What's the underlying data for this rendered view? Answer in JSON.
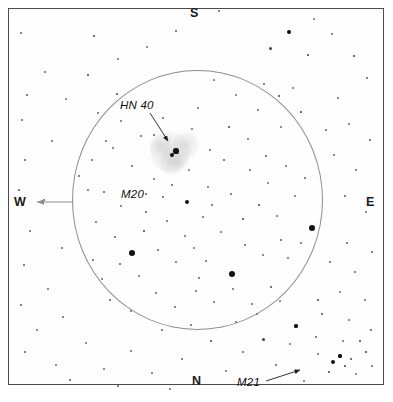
{
  "figure": {
    "kind": "star-chart",
    "frame_color": "#4b4b4b",
    "background_color": "#ffffff",
    "circle_color": "#8d8d8d",
    "star_color": "#111111",
    "nebula_color": "#d9d9d9"
  },
  "compass": {
    "north": "N",
    "south": "S",
    "east": "E",
    "west": "W"
  },
  "labels": {
    "hn40": "HN 40",
    "m20": "M20",
    "m21": "M21"
  },
  "chart_data": {
    "type": "scatter",
    "title": "",
    "subtitle": "",
    "xlabel": "",
    "ylabel": "",
    "xlim": [
      0,
      393
    ],
    "ylim": [
      0,
      402
    ],
    "grid": false,
    "legend": "none",
    "annotations": [
      {
        "text": "HN 40",
        "x": 120,
        "y": 105,
        "arrow_to": [
          168,
          143
        ],
        "style": "italic"
      },
      {
        "text": "M20",
        "x": 121,
        "y": 194,
        "arrow_to": null,
        "style": "italic"
      },
      {
        "text": "M21",
        "x": 237,
        "y": 382,
        "arrow_to": [
          300,
          369
        ],
        "style": "italic"
      },
      {
        "text": "S",
        "x": 190,
        "y": 16,
        "arrow_to": null,
        "style": "bold"
      },
      {
        "text": "N",
        "x": 192,
        "y": 384,
        "arrow_to": null,
        "style": "bold"
      },
      {
        "text": "W",
        "x": 14,
        "y": 205,
        "arrow_to": null,
        "style": "bold"
      },
      {
        "text": "E",
        "x": 366,
        "y": 205,
        "arrow_to": null,
        "style": "bold"
      }
    ],
    "fov_circle": {
      "cx": 197.5,
      "cy": 200,
      "rx": 125.5,
      "ry": 130
    },
    "west_arrow": {
      "from": [
        73,
        202
      ],
      "to": [
        35,
        202
      ]
    },
    "nebulosity": [
      {
        "cx": 170,
        "cy": 152,
        "r": 20,
        "opacity": 0.3
      },
      {
        "cx": 186,
        "cy": 145,
        "r": 13,
        "opacity": 0.26
      },
      {
        "cx": 172,
        "cy": 163,
        "r": 12,
        "opacity": 0.24
      },
      {
        "cx": 160,
        "cy": 145,
        "r": 11,
        "opacity": 0.2
      },
      {
        "cx": 180,
        "cy": 160,
        "r": 9,
        "opacity": 0.18
      }
    ],
    "stars": [
      {
        "x": 132,
        "y": 253,
        "r": 3.4
      },
      {
        "x": 312,
        "y": 228,
        "r": 3.1
      },
      {
        "x": 232,
        "y": 274,
        "r": 3.1
      },
      {
        "x": 187,
        "y": 202,
        "r": 2.4
      },
      {
        "x": 176,
        "y": 151,
        "r": 2.6
      },
      {
        "x": 172,
        "y": 155,
        "r": 2.2
      },
      {
        "x": 94,
        "y": 36,
        "r": 1.1
      },
      {
        "x": 118,
        "y": 59,
        "r": 0.9
      },
      {
        "x": 147,
        "y": 47,
        "r": 1.0
      },
      {
        "x": 176,
        "y": 31,
        "r": 0.8
      },
      {
        "x": 219,
        "y": 11,
        "r": 0.9
      },
      {
        "x": 289,
        "y": 32,
        "r": 1.9
      },
      {
        "x": 314,
        "y": 19,
        "r": 1.0
      },
      {
        "x": 332,
        "y": 34,
        "r": 0.9
      },
      {
        "x": 270,
        "y": 48,
        "r": 1.5
      },
      {
        "x": 308,
        "y": 55,
        "r": 1.1
      },
      {
        "x": 354,
        "y": 56,
        "r": 1.2
      },
      {
        "x": 264,
        "y": 84,
        "r": 0.8
      },
      {
        "x": 293,
        "y": 88,
        "r": 1.0
      },
      {
        "x": 338,
        "y": 98,
        "r": 0.9
      },
      {
        "x": 367,
        "y": 78,
        "r": 0.7
      },
      {
        "x": 21,
        "y": 33,
        "r": 0.8
      },
      {
        "x": 45,
        "y": 72,
        "r": 0.8
      },
      {
        "x": 27,
        "y": 95,
        "r": 0.7
      },
      {
        "x": 66,
        "y": 99,
        "r": 1.0
      },
      {
        "x": 22,
        "y": 120,
        "r": 0.8
      },
      {
        "x": 88,
        "y": 75,
        "r": 1.1
      },
      {
        "x": 117,
        "y": 94,
        "r": 1.4
      },
      {
        "x": 98,
        "y": 113,
        "r": 1.0
      },
      {
        "x": 52,
        "y": 141,
        "r": 0.9
      },
      {
        "x": 25,
        "y": 160,
        "r": 0.8
      },
      {
        "x": 19,
        "y": 190,
        "r": 0.7
      },
      {
        "x": 44,
        "y": 200,
        "r": 0.8
      },
      {
        "x": 30,
        "y": 231,
        "r": 0.9
      },
      {
        "x": 62,
        "y": 248,
        "r": 0.8
      },
      {
        "x": 24,
        "y": 265,
        "r": 0.8
      },
      {
        "x": 48,
        "y": 289,
        "r": 0.9
      },
      {
        "x": 21,
        "y": 305,
        "r": 0.7
      },
      {
        "x": 37,
        "y": 330,
        "r": 0.9
      },
      {
        "x": 63,
        "y": 317,
        "r": 0.8
      },
      {
        "x": 25,
        "y": 352,
        "r": 0.8
      },
      {
        "x": 56,
        "y": 365,
        "r": 0.9
      },
      {
        "x": 86,
        "y": 343,
        "r": 1.0
      },
      {
        "x": 70,
        "y": 380,
        "r": 0.8
      },
      {
        "x": 104,
        "y": 369,
        "r": 0.9
      },
      {
        "x": 131,
        "y": 351,
        "r": 0.9
      },
      {
        "x": 118,
        "y": 386,
        "r": 0.7
      },
      {
        "x": 152,
        "y": 373,
        "r": 0.8
      },
      {
        "x": 182,
        "y": 359,
        "r": 0.9
      },
      {
        "x": 170,
        "y": 389,
        "r": 0.7
      },
      {
        "x": 211,
        "y": 341,
        "r": 1.2
      },
      {
        "x": 226,
        "y": 371,
        "r": 0.9
      },
      {
        "x": 243,
        "y": 352,
        "r": 0.8
      },
      {
        "x": 263,
        "y": 339,
        "r": 1.5
      },
      {
        "x": 276,
        "y": 365,
        "r": 0.8
      },
      {
        "x": 290,
        "y": 344,
        "r": 1.0
      },
      {
        "x": 304,
        "y": 381,
        "r": 0.9
      },
      {
        "x": 318,
        "y": 354,
        "r": 0.9
      },
      {
        "x": 296,
        "y": 326,
        "r": 1.6
      },
      {
        "x": 316,
        "y": 337,
        "r": 0.8
      },
      {
        "x": 333,
        "y": 362,
        "r": 2.3
      },
      {
        "x": 340,
        "y": 356,
        "r": 1.6
      },
      {
        "x": 345,
        "y": 366,
        "r": 1.4
      },
      {
        "x": 351,
        "y": 359,
        "r": 1.2
      },
      {
        "x": 329,
        "y": 372,
        "r": 1.1
      },
      {
        "x": 356,
        "y": 374,
        "r": 1.0
      },
      {
        "x": 366,
        "y": 352,
        "r": 1.1
      },
      {
        "x": 360,
        "y": 341,
        "r": 1.4
      },
      {
        "x": 372,
        "y": 366,
        "r": 0.9
      },
      {
        "x": 343,
        "y": 341,
        "r": 1.0
      },
      {
        "x": 322,
        "y": 314,
        "r": 1.2
      },
      {
        "x": 349,
        "y": 320,
        "r": 0.9
      },
      {
        "x": 371,
        "y": 330,
        "r": 0.8
      },
      {
        "x": 365,
        "y": 300,
        "r": 0.9
      },
      {
        "x": 340,
        "y": 292,
        "r": 1.0
      },
      {
        "x": 318,
        "y": 300,
        "r": 1.1
      },
      {
        "x": 355,
        "y": 272,
        "r": 0.8
      },
      {
        "x": 372,
        "y": 252,
        "r": 0.8
      },
      {
        "x": 347,
        "y": 243,
        "r": 0.9
      },
      {
        "x": 330,
        "y": 262,
        "r": 0.8
      },
      {
        "x": 366,
        "y": 212,
        "r": 1.0
      },
      {
        "x": 345,
        "y": 196,
        "r": 0.8
      },
      {
        "x": 356,
        "y": 170,
        "r": 0.9
      },
      {
        "x": 334,
        "y": 155,
        "r": 0.8
      },
      {
        "x": 370,
        "y": 140,
        "r": 0.8
      },
      {
        "x": 349,
        "y": 124,
        "r": 0.9
      },
      {
        "x": 326,
        "y": 130,
        "r": 0.7
      },
      {
        "x": 301,
        "y": 112,
        "r": 1.1
      },
      {
        "x": 279,
        "y": 96,
        "r": 1.3
      },
      {
        "x": 281,
        "y": 127,
        "r": 1.0
      },
      {
        "x": 258,
        "y": 110,
        "r": 0.9
      },
      {
        "x": 236,
        "y": 95,
        "r": 1.0
      },
      {
        "x": 214,
        "y": 80,
        "r": 0.9
      },
      {
        "x": 198,
        "y": 108,
        "r": 0.9
      },
      {
        "x": 229,
        "y": 127,
        "r": 1.2
      },
      {
        "x": 248,
        "y": 139,
        "r": 0.9
      },
      {
        "x": 266,
        "y": 156,
        "r": 0.8
      },
      {
        "x": 210,
        "y": 150,
        "r": 0.9
      },
      {
        "x": 192,
        "y": 129,
        "r": 1.0
      },
      {
        "x": 163,
        "y": 118,
        "r": 0.9
      },
      {
        "x": 141,
        "y": 136,
        "r": 0.8
      },
      {
        "x": 121,
        "y": 121,
        "r": 1.0
      },
      {
        "x": 113,
        "y": 148,
        "r": 0.9
      },
      {
        "x": 132,
        "y": 166,
        "r": 0.8
      },
      {
        "x": 154,
        "y": 179,
        "r": 0.9
      },
      {
        "x": 172,
        "y": 185,
        "r": 0.8
      },
      {
        "x": 189,
        "y": 170,
        "r": 1.0
      },
      {
        "x": 208,
        "y": 187,
        "r": 0.9
      },
      {
        "x": 163,
        "y": 197,
        "r": 0.8
      },
      {
        "x": 146,
        "y": 212,
        "r": 0.8
      },
      {
        "x": 121,
        "y": 206,
        "r": 0.9
      },
      {
        "x": 104,
        "y": 192,
        "r": 0.8
      },
      {
        "x": 96,
        "y": 222,
        "r": 0.9
      },
      {
        "x": 115,
        "y": 237,
        "r": 0.9
      },
      {
        "x": 144,
        "y": 231,
        "r": 1.2
      },
      {
        "x": 167,
        "y": 221,
        "r": 0.9
      },
      {
        "x": 185,
        "y": 236,
        "r": 0.9
      },
      {
        "x": 203,
        "y": 217,
        "r": 0.9
      },
      {
        "x": 221,
        "y": 232,
        "r": 0.9
      },
      {
        "x": 243,
        "y": 219,
        "r": 1.3
      },
      {
        "x": 259,
        "y": 205,
        "r": 1.1
      },
      {
        "x": 277,
        "y": 216,
        "r": 0.9
      },
      {
        "x": 295,
        "y": 196,
        "r": 0.9
      },
      {
        "x": 305,
        "y": 178,
        "r": 0.8
      },
      {
        "x": 286,
        "y": 166,
        "r": 0.9
      },
      {
        "x": 268,
        "y": 183,
        "r": 1.0
      },
      {
        "x": 250,
        "y": 170,
        "r": 0.9
      },
      {
        "x": 231,
        "y": 194,
        "r": 0.8
      },
      {
        "x": 212,
        "y": 205,
        "r": 0.8
      },
      {
        "x": 194,
        "y": 248,
        "r": 1.0
      },
      {
        "x": 176,
        "y": 262,
        "r": 0.9
      },
      {
        "x": 158,
        "y": 250,
        "r": 0.8
      },
      {
        "x": 139,
        "y": 276,
        "r": 0.9
      },
      {
        "x": 120,
        "y": 264,
        "r": 0.8
      },
      {
        "x": 102,
        "y": 279,
        "r": 0.9
      },
      {
        "x": 156,
        "y": 293,
        "r": 0.9
      },
      {
        "x": 175,
        "y": 307,
        "r": 0.8
      },
      {
        "x": 196,
        "y": 291,
        "r": 0.9
      },
      {
        "x": 214,
        "y": 302,
        "r": 1.0
      },
      {
        "x": 233,
        "y": 289,
        "r": 0.9
      },
      {
        "x": 252,
        "y": 304,
        "r": 0.9
      },
      {
        "x": 271,
        "y": 287,
        "r": 1.1
      },
      {
        "x": 288,
        "y": 258,
        "r": 0.9
      },
      {
        "x": 301,
        "y": 243,
        "r": 1.0
      },
      {
        "x": 281,
        "y": 240,
        "r": 0.8
      },
      {
        "x": 263,
        "y": 255,
        "r": 0.9
      },
      {
        "x": 245,
        "y": 245,
        "r": 0.8
      },
      {
        "x": 131,
        "y": 311,
        "r": 0.9
      },
      {
        "x": 110,
        "y": 300,
        "r": 0.8
      },
      {
        "x": 93,
        "y": 260,
        "r": 0.8
      },
      {
        "x": 88,
        "y": 190,
        "r": 0.9
      },
      {
        "x": 92,
        "y": 160,
        "r": 0.8
      },
      {
        "x": 79,
        "y": 176,
        "r": 0.7
      },
      {
        "x": 106,
        "y": 141,
        "r": 0.8
      },
      {
        "x": 236,
        "y": 322,
        "r": 0.9
      },
      {
        "x": 257,
        "y": 314,
        "r": 0.8
      },
      {
        "x": 191,
        "y": 325,
        "r": 0.8
      },
      {
        "x": 162,
        "y": 330,
        "r": 0.8
      },
      {
        "x": 146,
        "y": 194,
        "r": 0.7
      },
      {
        "x": 206,
        "y": 261,
        "r": 0.7
      },
      {
        "x": 224,
        "y": 160,
        "r": 0.7
      },
      {
        "x": 154,
        "y": 135,
        "r": 0.7
      },
      {
        "x": 199,
        "y": 278,
        "r": 0.8
      },
      {
        "x": 280,
        "y": 301,
        "r": 0.9
      }
    ]
  }
}
